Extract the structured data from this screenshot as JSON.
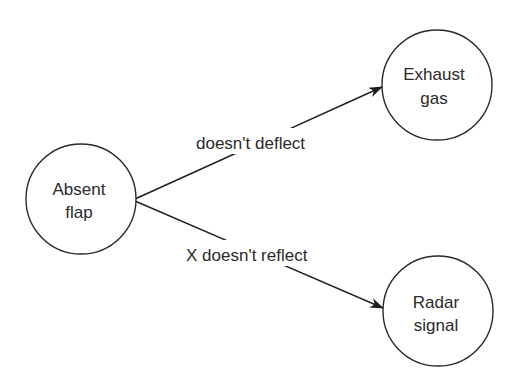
{
  "diagram": {
    "type": "directed-graph",
    "nodes": [
      {
        "id": "absent_flap",
        "line1": "Absent",
        "line2": "flap"
      },
      {
        "id": "exhaust_gas",
        "line1": "Exhaust",
        "line2": "gas"
      },
      {
        "id": "radar_signal",
        "line1": "Radar",
        "line2": "signal"
      }
    ],
    "edges": [
      {
        "from": "absent_flap",
        "to": "exhaust_gas",
        "label": "doesn't deflect"
      },
      {
        "from": "absent_flap",
        "to": "radar_signal",
        "label": "X doesn't reflect"
      }
    ],
    "colors": {
      "stroke": "#2a2a2a",
      "background": "#ffffff"
    }
  }
}
